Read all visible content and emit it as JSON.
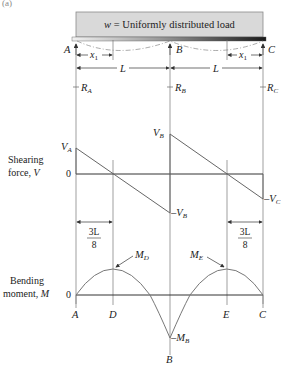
{
  "figure_label": "(a)",
  "load": {
    "label_var": "w",
    "label_text": " = Uniformly distributed load"
  },
  "supports": [
    {
      "name": "A",
      "reaction": "R",
      "reaction_sub": "A"
    },
    {
      "name": "B",
      "reaction": "R",
      "reaction_sub": "B"
    },
    {
      "name": "C",
      "reaction": "R",
      "reaction_sub": "C"
    }
  ],
  "dimensions": {
    "x1_left": "x",
    "x1_sub": "1",
    "span_left": "L",
    "span_right": "L",
    "x1_right": "x",
    "three_l_over_8_num": "3L",
    "three_l_over_8_den": "8"
  },
  "shear_diagram": {
    "axis_label_line1": "Shearing",
    "axis_label_line2": "force, ",
    "axis_label_var": "V",
    "zero": "0",
    "va": {
      "main": "V",
      "sub": "A"
    },
    "vb": {
      "main": "V",
      "sub": "B"
    },
    "neg_vb": {
      "prefix": "–",
      "main": "V",
      "sub": "B"
    },
    "neg_vc": {
      "prefix": "–",
      "main": "V",
      "sub": "C"
    }
  },
  "moment_diagram": {
    "axis_label_line1": "Bending",
    "axis_label_line2": "moment, ",
    "axis_label_var": "M",
    "zero": "0",
    "md": {
      "main": "M",
      "sub": "D"
    },
    "me": {
      "main": "M",
      "sub": "E"
    },
    "neg_mb": {
      "prefix": "–",
      "main": "M",
      "sub": "B"
    },
    "points": [
      "A",
      "D",
      "E",
      "C",
      "B"
    ]
  },
  "colors": {
    "line": "#444444",
    "load_fill": "#d9d9d9",
    "load_stroke": "#8a8a8a",
    "curve": "#777777",
    "text": "#222222"
  }
}
